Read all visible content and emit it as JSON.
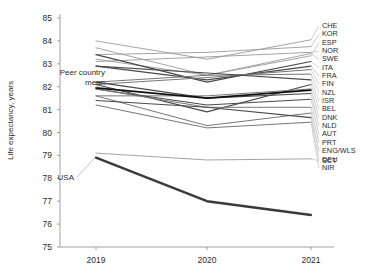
{
  "chart_data": {
    "type": "line",
    "subtype": "slopegraph",
    "title": "",
    "xlabel": "",
    "ylabel": "Life expectancy, years",
    "x": [
      "2019",
      "2020",
      "2021"
    ],
    "xticklabels": [
      "2019",
      "2020",
      "2021"
    ],
    "yticklabels": [
      "75",
      "76",
      "77",
      "78",
      "79",
      "80",
      "81",
      "82",
      "83",
      "84",
      "85"
    ],
    "ylim": [
      75,
      85
    ],
    "grid": false,
    "legend": "right-side country code labels",
    "annotations": [
      {
        "text": "Peer country mean",
        "points_to_series": "Peer country mean",
        "at_x": "2019"
      },
      {
        "text": "USA",
        "points_to_series": "USA",
        "at_x": "2019"
      }
    ],
    "series": [
      {
        "name": "CHE",
        "label": "CHE",
        "values": [
          84.0,
          83.2,
          84.05
        ],
        "style": "peer-light"
      },
      {
        "name": "KOR",
        "label": "KOR",
        "values": [
          83.4,
          83.5,
          83.75
        ],
        "style": "peer-light"
      },
      {
        "name": "ESP",
        "label": "ESP",
        "values": [
          83.7,
          82.5,
          83.35
        ],
        "style": "peer-light"
      },
      {
        "name": "NOR",
        "label": "NOR",
        "values": [
          83.1,
          83.3,
          83.5
        ],
        "style": "peer-light"
      },
      {
        "name": "SWE",
        "label": "SWE",
        "values": [
          83.2,
          82.5,
          83.45
        ],
        "style": "peer-light"
      },
      {
        "name": "ITA",
        "label": "ITA",
        "values": [
          83.4,
          82.2,
          83.1
        ],
        "style": "peer-dark"
      },
      {
        "name": "FRA",
        "label": "FRA",
        "values": [
          82.9,
          82.3,
          82.9
        ],
        "style": "peer-dark"
      },
      {
        "name": "FIN",
        "label": "FIN",
        "values": [
          82.1,
          82.4,
          82.75
        ],
        "style": "peer-mid"
      },
      {
        "name": "NZL",
        "label": "NZL",
        "values": [
          82.2,
          82.5,
          82.55
        ],
        "style": "peer-mid"
      },
      {
        "name": "ISR",
        "label": "ISR",
        "values": [
          82.9,
          82.6,
          82.3
        ],
        "style": "peer-dark"
      },
      {
        "name": "BEL",
        "label": "BEL",
        "values": [
          82.1,
          80.9,
          82.1
        ],
        "style": "peer-dark"
      },
      {
        "name": "DNK",
        "label": "DNK",
        "values": [
          81.6,
          81.6,
          81.9
        ],
        "style": "peer-mid"
      },
      {
        "name": "NLD",
        "label": "NLD",
        "values": [
          82.2,
          81.5,
          81.7
        ],
        "style": "peer-dark"
      },
      {
        "name": "AUT",
        "label": "AUT",
        "values": [
          81.9,
          81.2,
          81.45
        ],
        "style": "peer-dark"
      },
      {
        "name": "PRT",
        "label": "PRT",
        "values": [
          81.9,
          81.1,
          81.1
        ],
        "style": "peer-mid"
      },
      {
        "name": "ENG/WLS",
        "label": "ENG/WLS",
        "values": [
          81.6,
          80.3,
          80.85
        ],
        "style": "peer-mid"
      },
      {
        "name": "DEU",
        "label": "DEU",
        "values": [
          81.4,
          81.1,
          80.65
        ],
        "style": "peer-dark"
      },
      {
        "name": "NIR",
        "label": "NIR",
        "values": [
          81.2,
          80.2,
          80.45
        ],
        "style": "peer-mid"
      },
      {
        "name": "SCT",
        "label": "SCT",
        "values": [
          79.1,
          78.8,
          78.85
        ],
        "style": "peer-light"
      },
      {
        "name": "Peer country mean",
        "label": "",
        "values": [
          81.95,
          81.5,
          81.85
        ],
        "style": "mean"
      },
      {
        "name": "USA",
        "label": "",
        "values": [
          78.9,
          77.0,
          76.4
        ],
        "style": "usa"
      }
    ]
  },
  "axes": {
    "y_title": "Life expectancy, years"
  }
}
